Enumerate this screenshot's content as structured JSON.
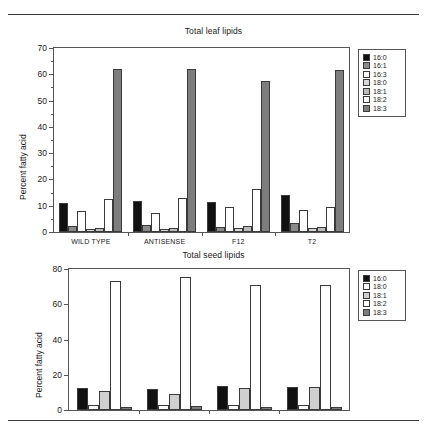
{
  "figure": {
    "panels": [
      "leaf",
      "seed"
    ]
  },
  "chart_data": [
    {
      "id": "leaf",
      "type": "bar",
      "title": "Total leaf lipids",
      "xlabel": "",
      "ylabel": "Percent fatty acid",
      "ylim": [
        0,
        70
      ],
      "yticks": [
        0,
        10,
        20,
        30,
        40,
        50,
        60,
        70
      ],
      "ytick_labels": [
        "0",
        "10",
        "20",
        "30",
        "40",
        "50",
        "60",
        "70"
      ],
      "grid": false,
      "legend_position": "right-outside",
      "categories": [
        "WILD TYPE",
        "ANTISENSE",
        "F12",
        "T2"
      ],
      "series": [
        {
          "name": "16:0",
          "color": "#111111",
          "values": [
            11.2,
            11.9,
            11.5,
            14.2
          ]
        },
        {
          "name": "16:1",
          "color": "#8a8a8a",
          "values": [
            2.2,
            2.5,
            1.9,
            3.3
          ]
        },
        {
          "name": "16:3",
          "color": "#ffffff",
          "values": [
            8.0,
            7.2,
            9.4,
            8.3
          ]
        },
        {
          "name": "18:0",
          "color": "#d8d8d8",
          "values": [
            1.3,
            1.2,
            1.4,
            1.6
          ]
        },
        {
          "name": "18:1",
          "color": "#bcbcbc",
          "values": [
            1.5,
            1.6,
            2.1,
            1.8
          ]
        },
        {
          "name": "18:2",
          "color": "#ffffff",
          "values": [
            12.6,
            13.1,
            16.4,
            9.5
          ]
        },
        {
          "name": "18:3",
          "color": "#7d7d7d",
          "values": [
            62.0,
            62.0,
            57.5,
            61.6
          ]
        }
      ]
    },
    {
      "id": "seed",
      "type": "bar",
      "title": "Total seed lipids",
      "xlabel": "",
      "ylabel": "Percent fatty acid",
      "ylim": [
        0,
        80
      ],
      "yticks": [
        0,
        20,
        40,
        60,
        80
      ],
      "ytick_labels": [
        "0",
        "20",
        "40",
        "60",
        "80"
      ],
      "grid": false,
      "legend_position": "right-outside",
      "categories": [
        "",
        "",
        "",
        ""
      ],
      "series": [
        {
          "name": "16:0",
          "color": "#111111",
          "values": [
            12.4,
            12.0,
            13.7,
            12.8
          ]
        },
        {
          "name": "18:0",
          "color": "#fbfbfb",
          "values": [
            2.6,
            2.7,
            2.9,
            2.9
          ]
        },
        {
          "name": "18:1",
          "color": "#d0d0d0",
          "values": [
            10.8,
            9.2,
            12.4,
            13.0
          ]
        },
        {
          "name": "18:2",
          "color": "#ffffff",
          "values": [
            73.3,
            75.4,
            71.2,
            71.2
          ]
        },
        {
          "name": "18:3",
          "color": "#7d7d7d",
          "values": [
            1.8,
            2.3,
            1.5,
            1.9
          ]
        }
      ]
    }
  ]
}
